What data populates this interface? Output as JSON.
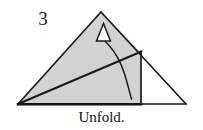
{
  "figure": {
    "step_label": "3",
    "caption": "Unfold.",
    "colors": {
      "paper_fill": "#d2d2d2",
      "outline": "#1a1a1a",
      "background": "#ffffff",
      "text": "#151515"
    },
    "geometry": {
      "base_line": {
        "x1": 18,
        "y1": 104,
        "x2": 186,
        "y2": 104
      },
      "large_triangle": [
        [
          18,
          104
        ],
        [
          101,
          12
        ],
        [
          186,
          104
        ]
      ],
      "shaded_polygon": [
        [
          18,
          104
        ],
        [
          101,
          12
        ],
        [
          141,
          52
        ],
        [
          141,
          104
        ]
      ],
      "fold_diagonal": {
        "x1": 18,
        "y1": 104,
        "x2": 141,
        "y2": 52
      },
      "vertical_edge": {
        "x1": 141,
        "y1": 52,
        "x2": 141,
        "y2": 104
      },
      "arrow_curve": {
        "start": [
          131,
          99
        ],
        "control": [
          121,
          56
        ],
        "end": [
          103,
          41
        ]
      },
      "arrow_head": [
        [
          103,
          24
        ],
        [
          110,
          41
        ],
        [
          96,
          41
        ]
      ]
    },
    "icons": {
      "arrow": "curved-unfold-arrow-icon",
      "arrowhead": "hollow-triangle-arrowhead-icon"
    }
  }
}
